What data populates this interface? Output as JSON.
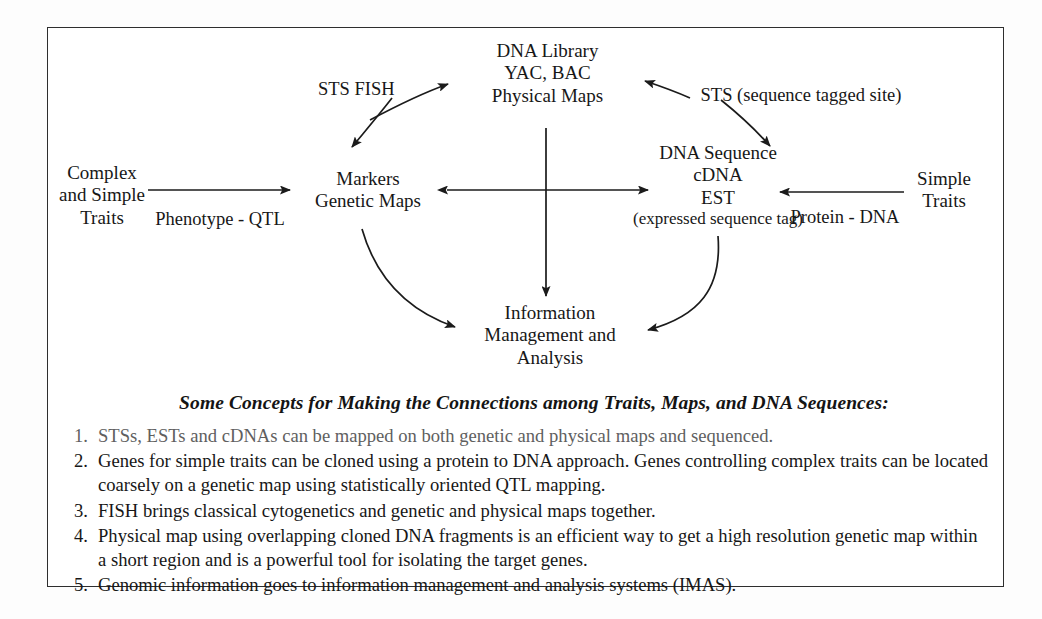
{
  "diagram": {
    "nodes": [
      {
        "id": "complex-traits",
        "lines": [
          "Complex",
          "and Simple",
          "Traits"
        ]
      },
      {
        "id": "markers",
        "lines": [
          "Markers",
          "Genetic Maps"
        ]
      },
      {
        "id": "dna-library",
        "lines": [
          "DNA Library",
          "YAC, BAC",
          "Physical Maps"
        ]
      },
      {
        "id": "dna-sequence",
        "lines": [
          "DNA Sequence",
          "cDNA",
          "EST"
        ],
        "sub": "(expressed sequence tag)"
      },
      {
        "id": "simple-traits",
        "lines": [
          "Simple",
          "Traits"
        ]
      },
      {
        "id": "information",
        "lines": [
          "Information",
          "Management and",
          "Analysis"
        ]
      }
    ],
    "edge_labels": [
      {
        "id": "phenotype-qtl",
        "text": "Phenotype - QTL"
      },
      {
        "id": "sts-fish",
        "lines": [
          "STS",
          "FISH"
        ]
      },
      {
        "id": "sts-sequence-tagged-site",
        "text": "STS (sequence tagged site)"
      },
      {
        "id": "protein-dna",
        "text": "Protein - DNA"
      }
    ]
  },
  "concepts": {
    "heading": "Some Concepts for Making the Connections among Traits, Maps, and DNA Sequences:",
    "items": [
      {
        "num": "1.",
        "text": "STSs, ESTs and cDNAs can be mapped on both genetic and physical maps and sequenced.",
        "faded": true
      },
      {
        "num": "2.",
        "text": "Genes for simple traits can be cloned using a protein to DNA approach. Genes controlling complex traits can be located coarsely on a genetic map using statistically oriented QTL mapping.",
        "faded": false
      },
      {
        "num": "3.",
        "text": "FISH brings classical cytogenetics and genetic and physical maps together.",
        "faded": false
      },
      {
        "num": "4.",
        "text": "Physical map using overlapping cloned DNA fragments is an efficient way to get a high resolution genetic map within a short region and is a powerful tool for isolating the target genes.",
        "faded": false
      },
      {
        "num": "5.",
        "text": "Genomic information goes to information management and analysis systems (IMAS).",
        "faded": false
      }
    ]
  },
  "colors": {
    "ink": "#171717",
    "frame": "#2e2e2e",
    "paper": "#ffffff"
  }
}
